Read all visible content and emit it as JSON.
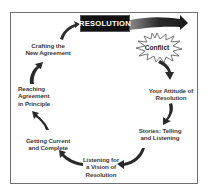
{
  "diagram": {
    "title_box": "RESOLUTION",
    "burst_label": "Conflict",
    "steps": [
      {
        "id": "attitude",
        "lines": [
          "Your Attitude of",
          "Resolution"
        ]
      },
      {
        "id": "stories",
        "lines": [
          "Stories: Telling",
          "and Listening"
        ]
      },
      {
        "id": "listening",
        "lines": [
          "Listening for",
          "a Vision of",
          "Resolution"
        ]
      },
      {
        "id": "getting-current",
        "lines": [
          "Getting Current",
          "and Complete"
        ]
      },
      {
        "id": "reaching",
        "lines": [
          "Reaching",
          "Agreement",
          "in Principle"
        ]
      },
      {
        "id": "crafting",
        "lines": [
          "Crafting the",
          "New Agreement"
        ]
      }
    ],
    "colors": {
      "frame_border": "#6e6e6e",
      "arrow_fill": "#333333",
      "title_box_bg": "#111111",
      "title_box_text": "#ffffff",
      "label_text": "#3a3a3a",
      "burst_fill": "#ffffff",
      "burst_stroke": "#555555"
    }
  }
}
